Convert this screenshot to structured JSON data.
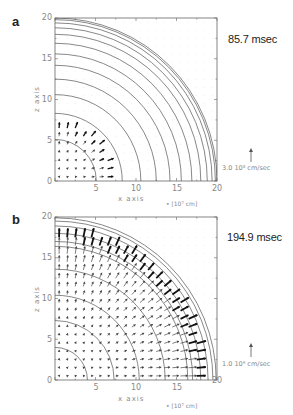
{
  "figure": {
    "panels": [
      {
        "label": "a",
        "time": "85.7 msec",
        "x_axis_title": "x axis",
        "y_axis_title": "z axis",
        "unit_label": "• [10⁷ cm]",
        "velocity_scale_label": "3.0  10⁸ cm/sec",
        "x_ticks": [
          "5",
          "10",
          "15",
          "20"
        ],
        "y_ticks": [
          "0",
          "5",
          "10",
          "15",
          "20"
        ]
      },
      {
        "label": "b",
        "time": "194.9 msec",
        "x_axis_title": "x axis",
        "y_axis_title": "z axis",
        "unit_label": "• [10⁷ cm]",
        "velocity_scale_label": "1.0  10⁹ cm/sec",
        "x_ticks": [
          "5",
          "10",
          "15",
          "20"
        ],
        "y_ticks": [
          "0",
          "5",
          "10",
          "15",
          "20"
        ]
      }
    ]
  },
  "chart_data": [
    {
      "type": "other",
      "subtype": "contour + vector field (quarter-plane)",
      "panel": "a",
      "title": "85.7 msec",
      "xlabel": "x axis [10^7 cm]",
      "ylabel": "z axis [10^7 cm]",
      "xlim": [
        0,
        20
      ],
      "ylim": [
        0,
        20
      ],
      "grid": false,
      "contour_radii": [
        5.1,
        8.3,
        10.6,
        12.5,
        14.2,
        15.6,
        16.9,
        18.0,
        18.8,
        19.4,
        19.8,
        20.0
      ],
      "vector_field": {
        "region_radius": 7.0,
        "grid_spacing": 1.0,
        "velocity_scale": "3.0 10^8 cm/sec",
        "direction": "outward radial, strongest near edge r≈6.5-7"
      }
    },
    {
      "type": "other",
      "subtype": "contour + vector field (quarter-plane)",
      "panel": "b",
      "title": "194.9 msec",
      "xlabel": "x axis [10^7 cm]",
      "ylabel": "z axis [10^7 cm]",
      "xlim": [
        0,
        20
      ],
      "ylim": [
        0,
        20
      ],
      "grid": false,
      "contour_radii": [
        4.0,
        7.3,
        10.4,
        13.6,
        16.4,
        17.0,
        18.0,
        18.9,
        19.5,
        19.9
      ],
      "vector_field": {
        "region_radius": 18.0,
        "grid_spacing": 1.0,
        "velocity_scale": "1.0 10^9 cm/sec",
        "direction": "outward radial, shock front at r≈17-18 with dense strong vectors"
      }
    }
  ]
}
